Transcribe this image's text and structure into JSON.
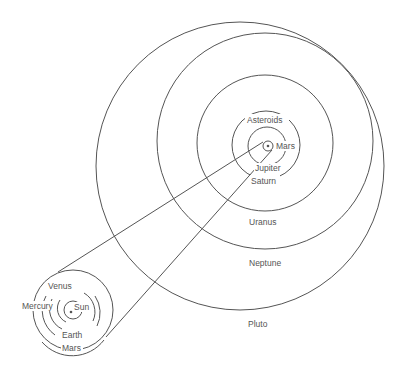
{
  "diagram": {
    "title": "",
    "outer_system": {
      "labels": {
        "mars": "Mars",
        "asteroids": "Asteroids",
        "jupiter": "Jupiter",
        "saturn": "Saturn",
        "uranus": "Uranus",
        "neptune": "Neptune",
        "pluto": "Pluto"
      }
    },
    "inner_system": {
      "labels": {
        "sun": "Sun",
        "mercury": "Mercury",
        "venus": "Venus",
        "earth": "Earth",
        "mars": "Mars"
      }
    },
    "colors": {
      "line": "#555555",
      "background": "#ffffff"
    }
  }
}
